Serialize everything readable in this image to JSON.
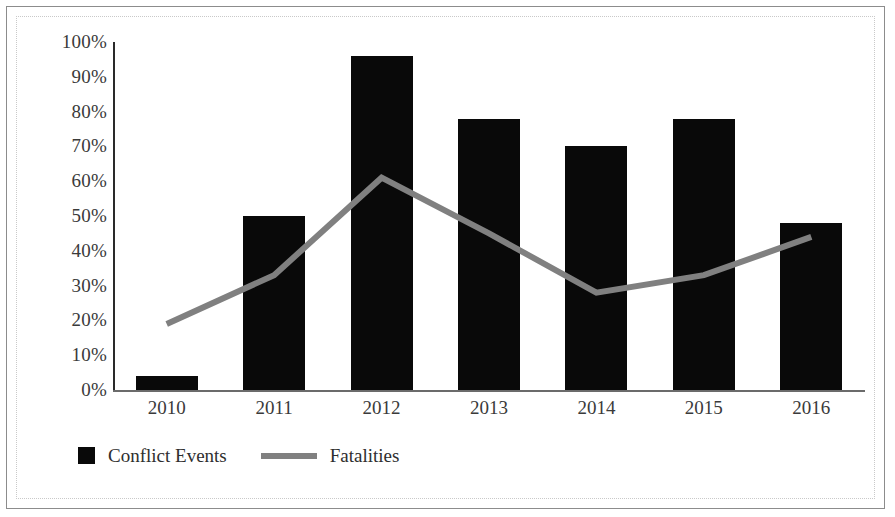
{
  "chart_data": {
    "type": "bar",
    "title": "",
    "subtitle": "",
    "xlabel": "",
    "ylabel": "",
    "categories": [
      "2010",
      "2011",
      "2012",
      "2013",
      "2014",
      "2015",
      "2016"
    ],
    "ylim": [
      0,
      100
    ],
    "y_ticks": [
      "0%",
      "10%",
      "20%",
      "30%",
      "40%",
      "50%",
      "60%",
      "70%",
      "80%",
      "90%",
      "100%"
    ],
    "y_tick_values": [
      0,
      10,
      20,
      30,
      40,
      50,
      60,
      70,
      80,
      90,
      100
    ],
    "grid": false,
    "legend_position": "bottom-left",
    "series": [
      {
        "name": "Conflict Events",
        "type": "bar",
        "color": "#090909",
        "values": [
          4,
          50,
          96,
          78,
          70,
          78,
          48
        ]
      },
      {
        "name": "Fatalities",
        "type": "line",
        "color": "#808080",
        "values": [
          19,
          33,
          61,
          45,
          28,
          33,
          44
        ]
      }
    ]
  },
  "legend": {
    "items": [
      {
        "label": "Conflict Events",
        "marker": "square-swatch-icon",
        "color": "#090909"
      },
      {
        "label": "Fatalities",
        "marker": "line-swatch-icon",
        "color": "#808080"
      }
    ]
  },
  "colors": {
    "bar": "#090909",
    "line": "#808080",
    "axis": "#2a2a2a",
    "text": "#3a3a3a",
    "frame": "#8c8c8c",
    "background": "#ffffff"
  }
}
